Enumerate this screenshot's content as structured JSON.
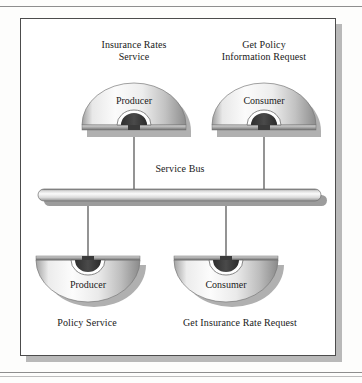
{
  "diagram": {
    "title_visible": false,
    "bus": {
      "label": "Service Bus",
      "name": "service-bus"
    },
    "nodes": [
      {
        "id": "top-left",
        "caption": "Insurance Rates\nService",
        "role": "Producer",
        "shape": "dome-up",
        "position": "top-left"
      },
      {
        "id": "top-right",
        "caption": "Get Policy\nInformation Request",
        "role": "Consumer",
        "shape": "dome-up",
        "position": "top-right"
      },
      {
        "id": "bottom-left",
        "caption": "Policy Service",
        "role": "Producer",
        "shape": "dome-down",
        "position": "bottom-left"
      },
      {
        "id": "bottom-right",
        "caption": "Get Insurance Rate Request",
        "role": "Consumer",
        "shape": "dome-down",
        "position": "bottom-right"
      }
    ],
    "connectors": [
      {
        "from": "top-left",
        "to": "service-bus"
      },
      {
        "from": "top-right",
        "to": "service-bus"
      },
      {
        "from": "service-bus",
        "to": "bottom-left"
      },
      {
        "from": "service-bus",
        "to": "bottom-right"
      }
    ],
    "colors": {
      "frame_border": "#4c4c4c",
      "frame_shadow": "#b9b9b9",
      "background": "#ffffff",
      "connector": "#555555",
      "dome_light": "#f4f4f4",
      "dome_mid": "#d2d2d2",
      "dome_dark": "#8a8a8a",
      "arch_dark": "#3a3a3a",
      "bus_light": "#f2f2f2",
      "bus_dark": "#9a9a9a",
      "text": "#191919"
    }
  }
}
